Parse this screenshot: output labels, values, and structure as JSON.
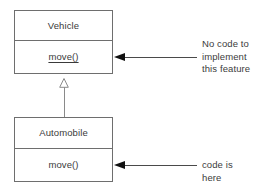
{
  "diagram": {
    "type": "uml-class-diagram",
    "classes": [
      {
        "id": "vehicle",
        "name": "Vehicle",
        "operations": [
          {
            "label": "move()",
            "underlined": true
          }
        ]
      },
      {
        "id": "automobile",
        "name": "Automobile",
        "operations": [
          {
            "label": "move()",
            "underlined": false
          }
        ]
      }
    ],
    "relationships": [
      {
        "kind": "generalization",
        "from": "automobile",
        "to": "vehicle",
        "arrow": "hollow-triangle"
      }
    ],
    "annotations": [
      {
        "id": "vehicle-note",
        "text": "No code to\nimplement\nthis feature",
        "target": "vehicle",
        "arrow": "solid-arrowhead"
      },
      {
        "id": "automobile-note",
        "text": "code is\nhere",
        "target": "automobile",
        "arrow": "solid-arrowhead"
      }
    ]
  },
  "colors": {
    "box_border": "#6e6e6e",
    "text": "#3a3a3a",
    "connector": "#8a8a8a",
    "arrow_fill": "#111111",
    "background": "#ffffff"
  }
}
